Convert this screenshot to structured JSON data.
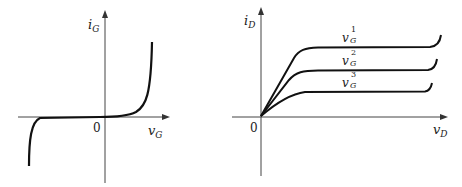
{
  "left_plot": {
    "y_label": "i",
    "y_label_sub": "G",
    "x_label": "v",
    "x_label_sub": "G",
    "origin": "0"
  },
  "right_plot": {
    "y_label": "i",
    "y_label_sub": "D",
    "x_label": "v",
    "x_label_sub": "D",
    "origin": "0",
    "curves": [
      {
        "label": "v",
        "sub": "G",
        "sup": "1"
      },
      {
        "label": "v",
        "sub": "G",
        "sup": "2"
      },
      {
        "label": "v",
        "sub": "G",
        "sup": "3"
      }
    ]
  },
  "colors": {
    "ink": "#222222",
    "background": "#ffffff"
  }
}
